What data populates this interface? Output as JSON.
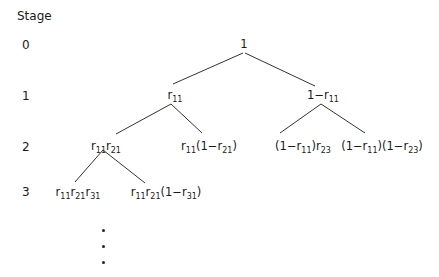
{
  "header": {
    "stage_label": "Stage"
  },
  "stages": [
    "0",
    "1",
    "2",
    "3"
  ],
  "tree": {
    "root": {
      "id": "n0",
      "label_html": "1"
    },
    "stage1": [
      {
        "id": "n1a",
        "label_html": "r<sub>11</sub>"
      },
      {
        "id": "n1b",
        "label_html": "1−r<sub>11</sub>"
      }
    ],
    "stage2": [
      {
        "id": "n2a",
        "label_html": "r<sub>11</sub>r<sub>21</sub>"
      },
      {
        "id": "n2b",
        "label_html": "r<sub>11</sub>(1−r<sub>21</sub>)"
      },
      {
        "id": "n2c",
        "label_html": "(1−r<sub>11</sub>)r<sub>23</sub>"
      },
      {
        "id": "n2d",
        "label_html": "(1−r<sub>11</sub>)(1−r<sub>23</sub>)"
      }
    ],
    "stage3": [
      {
        "id": "n3a",
        "label_html": "r<sub>11</sub>r<sub>21</sub>r<sub>31</sub>"
      },
      {
        "id": "n3b",
        "label_html": "r<sub>11</sub>r<sub>21</sub>(1−r<sub>31</sub>)"
      }
    ],
    "continuation": "⋮",
    "edges": [
      [
        "n0",
        "n1a"
      ],
      [
        "n0",
        "n1b"
      ],
      [
        "n1a",
        "n2a"
      ],
      [
        "n1a",
        "n2b"
      ],
      [
        "n1b",
        "n2c"
      ],
      [
        "n1b",
        "n2d"
      ],
      [
        "n2a",
        "n3a"
      ],
      [
        "n2a",
        "n3b"
      ]
    ]
  },
  "colors": {
    "line": "#333333",
    "text": "#1a1a1a",
    "background": "#ffffff"
  }
}
